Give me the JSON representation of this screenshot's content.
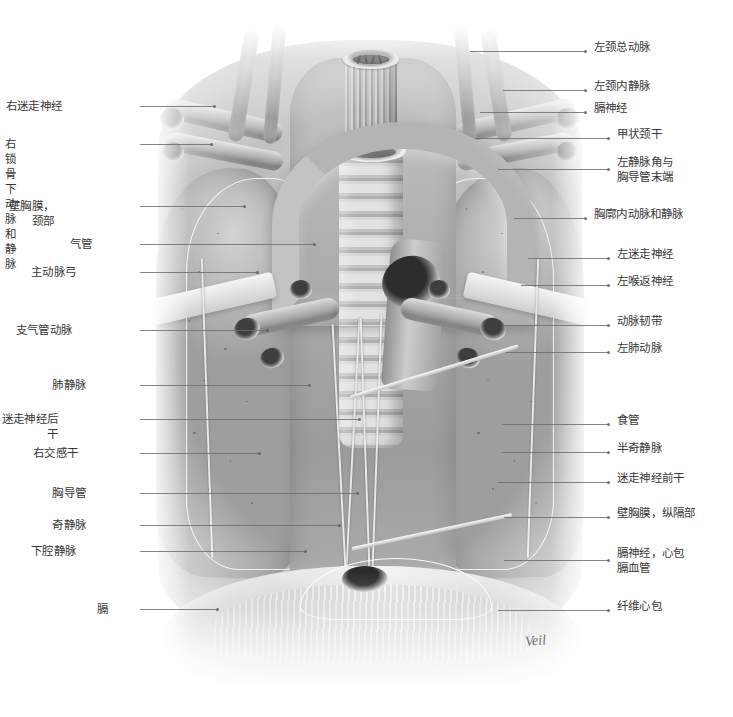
{
  "figure": {
    "type": "anatomical-illustration",
    "palette": {
      "ink": "#373737",
      "leader": "#6f6f6f",
      "background": "#ffffff"
    },
    "signature": "Veil"
  },
  "labels_left": [
    {
      "id": "right-vagus-nerve",
      "text": "右迷走神经",
      "x": 62,
      "y": 99,
      "leader_x": 140,
      "leader_len": 75,
      "leader_dy": 2
    },
    {
      "id": "right-subclavian-artery-vein",
      "text": "右锁骨下动脉和静脉",
      "x": 16,
      "y": 137,
      "leader_x": 140,
      "leader_len": 72,
      "leader_dy": 2
    },
    {
      "id": "parietal-pleura-cervical",
      "text": "壁胸膜，颈部",
      "x": 54,
      "y": 199,
      "leader_x": 140,
      "leader_len": 105,
      "leader_dy": 2
    },
    {
      "id": "trachea",
      "text": "气管",
      "x": 92,
      "y": 237,
      "leader_x": 140,
      "leader_len": 175,
      "leader_dy": 2
    },
    {
      "id": "aortic-arch",
      "text": "主动脉弓",
      "x": 76,
      "y": 265,
      "leader_x": 140,
      "leader_len": 118,
      "leader_dy": 2
    },
    {
      "id": "bronchial-artery",
      "text": "支气管动脉",
      "x": 72,
      "y": 323,
      "leader_x": 140,
      "leader_len": 128,
      "leader_dy": 2
    },
    {
      "id": "pulmonary-veins",
      "text": "肺静脉",
      "x": 86,
      "y": 378,
      "leader_x": 140,
      "leader_len": 170,
      "leader_dy": 2
    },
    {
      "id": "posterior-vagal-trunk",
      "text": "迷走神经后干",
      "x": 58,
      "y": 412,
      "leader_x": 140,
      "leader_len": 220,
      "leader_dy": 2
    },
    {
      "id": "right-sympathetic-trunk",
      "text": "右交感干",
      "x": 78,
      "y": 446,
      "leader_x": 140,
      "leader_len": 120,
      "leader_dy": 2
    },
    {
      "id": "thoracic-duct",
      "text": "胸导管",
      "x": 86,
      "y": 486,
      "leader_x": 140,
      "leader_len": 218,
      "leader_dy": 2
    },
    {
      "id": "azygos-vein",
      "text": "奇静脉",
      "x": 86,
      "y": 518,
      "leader_x": 140,
      "leader_len": 200,
      "leader_dy": 2
    },
    {
      "id": "inferior-vena-cava",
      "text": "下腔静脉",
      "x": 76,
      "y": 544,
      "leader_x": 140,
      "leader_len": 166,
      "leader_dy": 2
    },
    {
      "id": "diaphragm",
      "text": "膈",
      "x": 108,
      "y": 602,
      "leader_x": 140,
      "leader_len": 78,
      "leader_dy": 2
    }
  ],
  "labels_right": [
    {
      "id": "left-common-carotid-artery",
      "text": "左颈总动脉",
      "x": 594,
      "y": 40,
      "leader_x": 470,
      "leader_len": 118,
      "leader_dy": 6
    },
    {
      "id": "left-internal-jugular-vein",
      "text": "左颈内静脉",
      "x": 594,
      "y": 79,
      "leader_x": 503,
      "leader_len": 86,
      "leader_dy": 6
    },
    {
      "id": "phrenic-nerve",
      "text": "膈神经",
      "x": 594,
      "y": 101,
      "leader_x": 480,
      "leader_len": 108,
      "leader_dy": 6
    },
    {
      "id": "thyrocervical-trunk",
      "text": "甲状颈干",
      "x": 617,
      "y": 127,
      "leader_x": 475,
      "leader_len": 136,
      "leader_dy": 6
    },
    {
      "id": "left-venous-angle-duct-end",
      "text": "左静脉角与\n胸导管末端",
      "x": 617,
      "y": 155,
      "leader_x": 498,
      "leader_len": 113,
      "leader_dy": 9
    },
    {
      "id": "internal-thoracic-vessels",
      "text": "胸廓内动脉和静脉",
      "x": 594,
      "y": 207,
      "leader_x": 514,
      "leader_len": 74,
      "leader_dy": 6
    },
    {
      "id": "left-vagus-nerve",
      "text": "左迷走神经",
      "x": 617,
      "y": 247,
      "leader_x": 528,
      "leader_len": 83,
      "leader_dy": 6
    },
    {
      "id": "left-recurrent-laryngeal-nerve",
      "text": "左喉返神经",
      "x": 617,
      "y": 274,
      "leader_x": 521,
      "leader_len": 90,
      "leader_dy": 6
    },
    {
      "id": "ligamentum-arteriosum",
      "text": "动脉韧带",
      "x": 617,
      "y": 314,
      "leader_x": 504,
      "leader_len": 107,
      "leader_dy": 6
    },
    {
      "id": "left-pulmonary-artery",
      "text": "左肺动脉",
      "x": 617,
      "y": 341,
      "leader_x": 506,
      "leader_len": 105,
      "leader_dy": 6
    },
    {
      "id": "esophagus",
      "text": "食管",
      "x": 617,
      "y": 413,
      "leader_x": 502,
      "leader_len": 109,
      "leader_dy": 6
    },
    {
      "id": "hemiazygos-vein",
      "text": "半奇静脉",
      "x": 617,
      "y": 441,
      "leader_x": 502,
      "leader_len": 109,
      "leader_dy": 6
    },
    {
      "id": "anterior-vagal-trunk",
      "text": "迷走神经前干",
      "x": 617,
      "y": 471,
      "leader_x": 498,
      "leader_len": 113,
      "leader_dy": 6
    },
    {
      "id": "parietal-pleura-mediastinal",
      "text": "壁胸膜，纵隔部",
      "x": 617,
      "y": 506,
      "leader_x": 504,
      "leader_len": 107,
      "leader_dy": 6
    },
    {
      "id": "phrenic-nerve-pericardiacophrenic",
      "text": "膈神经，心包\n膈血管",
      "x": 617,
      "y": 546,
      "leader_x": 504,
      "leader_len": 107,
      "leader_dy": 9
    },
    {
      "id": "fibrous-pericardium",
      "text": "纤维心包",
      "x": 617,
      "y": 599,
      "leader_x": 498,
      "leader_len": 113,
      "leader_dy": 6
    }
  ]
}
